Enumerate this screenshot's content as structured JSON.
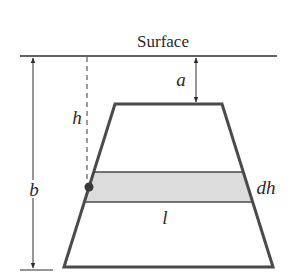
{
  "diagram": {
    "surface_label": "Surface",
    "labels": {
      "a": "a",
      "h": "h",
      "b": "b",
      "dh": "dh",
      "l": "l"
    },
    "colors": {
      "line": "#2e2e2e",
      "shape_edge": "#4a4a4a",
      "band_fill": "#dcdcdc",
      "dot": "#3a3a3a"
    }
  }
}
